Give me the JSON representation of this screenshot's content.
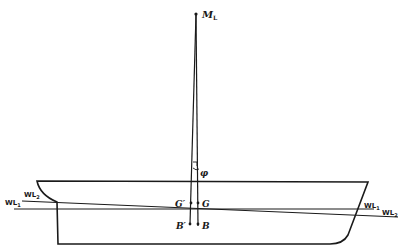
{
  "diagram": {
    "type": "ship-trim-longitudinal-metacentre",
    "labels": {
      "metacentre": "M",
      "metacentre_sub": "L",
      "angle": "φ",
      "g_prime": "G′",
      "g": "G",
      "b_prime": "B′",
      "b": "B",
      "wl1_left": "WL",
      "wl1_left_sub": "1",
      "wl2_left": "WL",
      "wl2_left_sub": "2",
      "wl1_right": "WL",
      "wl1_right_sub": "1",
      "wl2_right": "WL",
      "wl2_right_sub": "2"
    },
    "colors": {
      "line": "#1a1a1a",
      "background": "#ffffff"
    }
  }
}
